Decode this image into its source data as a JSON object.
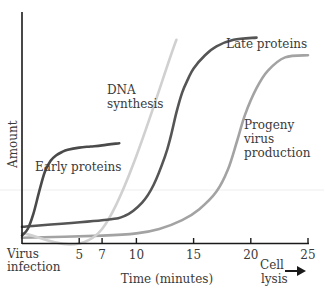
{
  "chart_data": {
    "type": "line",
    "title": "",
    "xlabel": "Time (minutes)",
    "ylabel": "Amount",
    "xlim": [
      0,
      25
    ],
    "ylim": [
      0,
      100
    ],
    "grid": false,
    "x_ticks": [
      5,
      7,
      10,
      15,
      20,
      25
    ],
    "x_tick_labels": [
      "5",
      "7",
      "10",
      "15",
      "20",
      "25"
    ],
    "x_start_label": [
      "Virus",
      "infection"
    ],
    "x_end_label": [
      "Cell",
      "lysis"
    ],
    "series": [
      {
        "name": "Early proteins",
        "label_lines": [
          "Early proteins"
        ],
        "color": "#4a4a4a",
        "x": [
          0,
          0.5,
          1,
          1.5,
          2,
          2.5,
          3,
          3.5,
          4,
          5,
          6,
          7,
          8.5
        ],
        "y": [
          2,
          5,
          12,
          22,
          31,
          36,
          38.5,
          40,
          41,
          42,
          42.5,
          43,
          44
        ]
      },
      {
        "name": "DNA synthesis",
        "label_lines": [
          "DNA",
          "synthesis"
        ],
        "color": "#d0d0d0",
        "x": [
          0,
          7,
          13.5
        ],
        "y": [
          3,
          5,
          91
        ]
      },
      {
        "name": "Late proteins",
        "label_lines": [
          "Late proteins"
        ],
        "color": "#555555",
        "x": [
          0,
          7,
          9,
          10.5,
          11.5,
          12.5,
          13,
          13.5,
          14,
          14.5,
          15,
          16,
          17,
          18.5,
          20.5
        ],
        "y": [
          6,
          9,
          11,
          17,
          25,
          38,
          47,
          58,
          67,
          73,
          78,
          84,
          88,
          91,
          92
        ]
      },
      {
        "name": "Progeny virus production",
        "label_lines": [
          "Progeny",
          "virus",
          "production"
        ],
        "color": "#a3a3a3",
        "x": [
          0,
          7,
          10,
          12,
          14,
          15.5,
          17,
          18,
          18.8,
          19.5,
          20.5,
          21.5,
          23,
          25
        ],
        "y": [
          1,
          2,
          3,
          5,
          9,
          14,
          22,
          32,
          45,
          57,
          69,
          77,
          83,
          84
        ]
      }
    ]
  }
}
